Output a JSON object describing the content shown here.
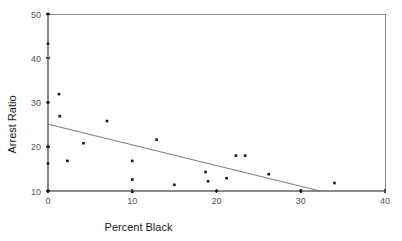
{
  "chart_data": {
    "type": "scatter",
    "title": "",
    "xlabel": "Percent Black",
    "ylabel": "Arrest Ratio",
    "xlim": [
      0,
      40
    ],
    "ylim": [
      10,
      50
    ],
    "xticks": [
      0,
      10,
      20,
      30,
      40
    ],
    "xtick_labels": [
      "0",
      "10",
      "20",
      "30",
      "40"
    ],
    "yticks": [
      10,
      20,
      30,
      40,
      50
    ],
    "ytick_labels": [
      "10",
      "20",
      "30",
      "40",
      "50"
    ],
    "grid": false,
    "legend": "none",
    "points": [
      {
        "x": 0.0,
        "y": 50.0
      },
      {
        "x": 0.0,
        "y": 43.3
      },
      {
        "x": 0.0,
        "y": 30.0
      },
      {
        "x": 0.0,
        "y": 20.0
      },
      {
        "x": 0.0,
        "y": 16.2
      },
      {
        "x": 0.0,
        "y": 10.0
      },
      {
        "x": 1.3,
        "y": 31.9
      },
      {
        "x": 1.4,
        "y": 26.9
      },
      {
        "x": 2.3,
        "y": 16.8
      },
      {
        "x": 4.2,
        "y": 20.8
      },
      {
        "x": 7.0,
        "y": 25.8
      },
      {
        "x": 10.0,
        "y": 16.8
      },
      {
        "x": 10.0,
        "y": 12.6
      },
      {
        "x": 10.0,
        "y": 9.8
      },
      {
        "x": 12.9,
        "y": 21.6
      },
      {
        "x": 15.0,
        "y": 11.4
      },
      {
        "x": 18.7,
        "y": 14.3
      },
      {
        "x": 19.0,
        "y": 12.2
      },
      {
        "x": 20.0,
        "y": 10.0
      },
      {
        "x": 21.2,
        "y": 12.9
      },
      {
        "x": 22.3,
        "y": 18.0
      },
      {
        "x": 23.4,
        "y": 18.0
      },
      {
        "x": 26.2,
        "y": 13.8
      },
      {
        "x": 30.0,
        "y": 10.0
      },
      {
        "x": 34.0,
        "y": 11.8
      }
    ],
    "fit_line": {
      "label": "regression-line",
      "x0": 0.0,
      "y0": 25.1,
      "x1": 32.3,
      "y1": 10.0
    },
    "colors": {
      "point": "#1a1a1a",
      "fit_line": "#6b6b6b",
      "axis": "#8a8a8a",
      "tick_label": "#555555",
      "axis_title": "#1a1a1a",
      "background": "#ffffff"
    }
  }
}
